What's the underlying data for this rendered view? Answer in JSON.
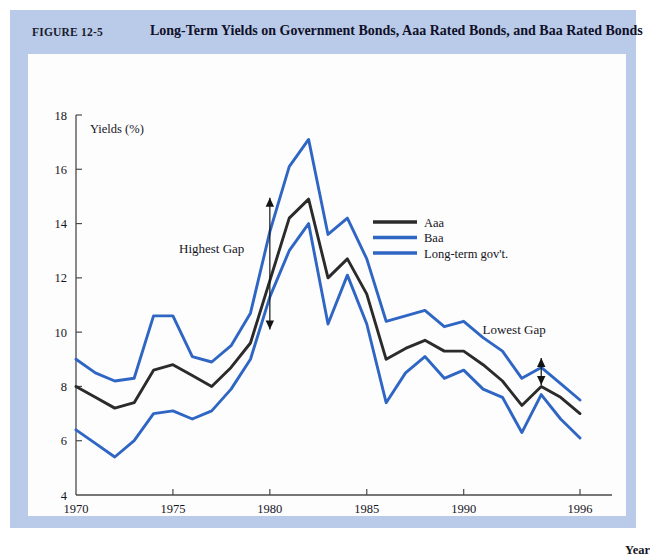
{
  "figure": {
    "number": "FIGURE 12-5",
    "title": "Long-Term Yields on Government Bonds, Aaa Rated Bonds, and Baa Rated Bonds"
  },
  "colors": {
    "frame": "#b9cbe8",
    "panel": "#fdfdfd",
    "aaa": "#2b2b2b",
    "baa": "#2f66c4",
    "govt": "#2f66c4",
    "axis": "#4a4a4a"
  },
  "annotations": [
    {
      "name": "highest-gap",
      "text": "Highest Gap",
      "x": 1977.0,
      "y": 12.9
    },
    {
      "name": "lowest-gap",
      "text": "Lowest Gap",
      "x": 1992.6,
      "y": 9.95
    }
  ],
  "arrows": [
    {
      "name": "highest-gap-arrow",
      "x": 1980.0,
      "y_top": 14.95,
      "y_bottom": 10.1
    },
    {
      "name": "lowest-gap-arrow",
      "x": 1994.0,
      "y_top": 9.05,
      "y_bottom": 8.05
    }
  ],
  "chart_data": {
    "type": "line",
    "title": "Long-Term Yields on Government Bonds, Aaa Rated Bonds, and Baa Rated Bonds",
    "xlabel": "Year",
    "ylabel": "Yields (%)",
    "xlim": [
      1970,
      1996
    ],
    "ylim": [
      4,
      18
    ],
    "yticks": [
      4,
      6,
      8,
      10,
      12,
      14,
      16,
      18
    ],
    "xticks": [
      1970,
      1975,
      1980,
      1985,
      1990,
      1996
    ],
    "xticklabels": [
      "1970",
      "1975",
      "1980",
      "1985",
      "1990",
      "1996"
    ],
    "grid": false,
    "legend_position": "upper-center-right",
    "x": [
      1970,
      1971,
      1972,
      1973,
      1974,
      1975,
      1976,
      1977,
      1978,
      1979,
      1980,
      1981,
      1982,
      1983,
      1984,
      1985,
      1986,
      1987,
      1988,
      1989,
      1990,
      1991,
      1992,
      1993,
      1994,
      1995,
      1996
    ],
    "series": [
      {
        "name": "Aaa",
        "color": "#2b2b2b",
        "values": [
          8.0,
          7.6,
          7.2,
          7.4,
          8.6,
          8.8,
          8.4,
          8.0,
          8.7,
          9.6,
          11.9,
          14.2,
          14.9,
          12.0,
          12.7,
          11.4,
          9.0,
          9.4,
          9.7,
          9.3,
          9.3,
          8.8,
          8.2,
          7.3,
          8.0,
          7.6,
          7.0
        ]
      },
      {
        "name": "Baa",
        "color": "#2f66c4",
        "values": [
          9.0,
          8.5,
          8.2,
          8.3,
          10.6,
          10.6,
          9.1,
          8.9,
          9.5,
          10.7,
          13.7,
          16.1,
          17.1,
          13.6,
          14.2,
          12.7,
          10.4,
          10.6,
          10.8,
          10.2,
          10.4,
          9.8,
          9.3,
          8.3,
          8.7,
          8.1,
          7.5
        ]
      },
      {
        "name": "Long-term gov't.",
        "color": "#2f66c4",
        "values": [
          6.4,
          5.9,
          5.4,
          6.0,
          7.0,
          7.1,
          6.8,
          7.1,
          7.9,
          9.0,
          11.3,
          13.0,
          14.0,
          10.3,
          12.1,
          10.3,
          7.4,
          8.5,
          9.1,
          8.3,
          8.6,
          7.9,
          7.6,
          6.3,
          7.7,
          6.8,
          6.1
        ]
      }
    ]
  },
  "legend": [
    {
      "label": "Aaa",
      "color": "#2b2b2b"
    },
    {
      "label": "Baa",
      "color": "#2f66c4"
    },
    {
      "label": "Long-term gov't.",
      "color": "#2f66c4"
    }
  ],
  "captions": {
    "y_axis": "Yields (%)",
    "x_axis": "Year"
  }
}
